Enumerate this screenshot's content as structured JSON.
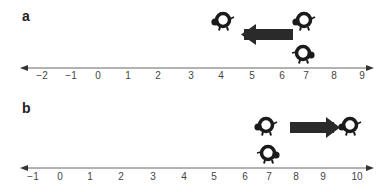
{
  "panels": {
    "a": {
      "label": "a",
      "ticks": [
        "−2",
        "−1",
        "0",
        "1",
        "2",
        "3",
        "4",
        "5",
        "6",
        "7",
        "8",
        "9"
      ],
      "arrow_direction": "left",
      "top_turtles": [
        {
          "position": 4,
          "facing": "left"
        },
        {
          "position": 6.9,
          "facing": "left"
        }
      ],
      "line_turtle": {
        "position": 7,
        "facing": "right"
      }
    },
    "b": {
      "label": "b",
      "ticks": [
        "−1",
        "0",
        "1",
        "2",
        "3",
        "4",
        "5",
        "6",
        "7",
        "8",
        "9",
        "10"
      ],
      "arrow_direction": "right",
      "top_turtles": [
        {
          "position": 7,
          "facing": "left"
        },
        {
          "position": 9.8,
          "facing": "left"
        }
      ],
      "line_turtle": {
        "position": 7,
        "facing": "right"
      }
    }
  },
  "colors": {
    "axis": "#555555",
    "arrow": "#222222",
    "turtle": "#1a1a1a",
    "text": "#444444"
  }
}
